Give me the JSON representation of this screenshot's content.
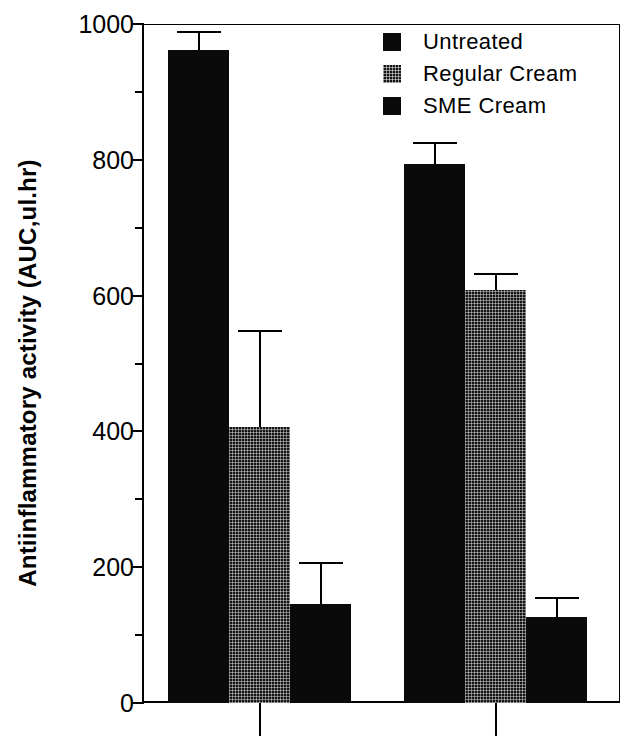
{
  "chart_data": {
    "type": "bar",
    "title": "",
    "xlabel": "",
    "ylabel": "Antiinflammatory activity (AUC,ul.hr)",
    "ylim": [
      0,
      1000
    ],
    "ytick_labels": [
      "0",
      "200",
      "400",
      "600",
      "800",
      "1000"
    ],
    "ytick_values": [
      0,
      200,
      400,
      600,
      800,
      1000
    ],
    "yminor_values": [
      100,
      300,
      500,
      700,
      900
    ],
    "grid": false,
    "legend_position": "top-right",
    "categories": [
      "Group 1",
      "Group 2"
    ],
    "xtick_labels": [
      "",
      ""
    ],
    "series": [
      {
        "name": "Untreated",
        "fill": "solid",
        "values": [
          962,
          794
        ],
        "errors": [
          28,
          32
        ]
      },
      {
        "name": "Regular Cream",
        "fill": "hatch",
        "values": [
          406,
          608
        ],
        "errors": [
          143,
          25
        ]
      },
      {
        "name": "SME Cream",
        "fill": "solid",
        "values": [
          146,
          127
        ],
        "errors": [
          62,
          29
        ]
      }
    ]
  },
  "legend": {
    "items": [
      {
        "label": "Untreated",
        "fill": "solid"
      },
      {
        "label": "Regular Cream",
        "fill": "hatch"
      },
      {
        "label": "SME Cream",
        "fill": "solid"
      }
    ]
  },
  "colors": {
    "bar_solid": "#0a0a0a",
    "bar_hatch": "#141414",
    "axis": "#000000",
    "background": "#ffffff"
  }
}
